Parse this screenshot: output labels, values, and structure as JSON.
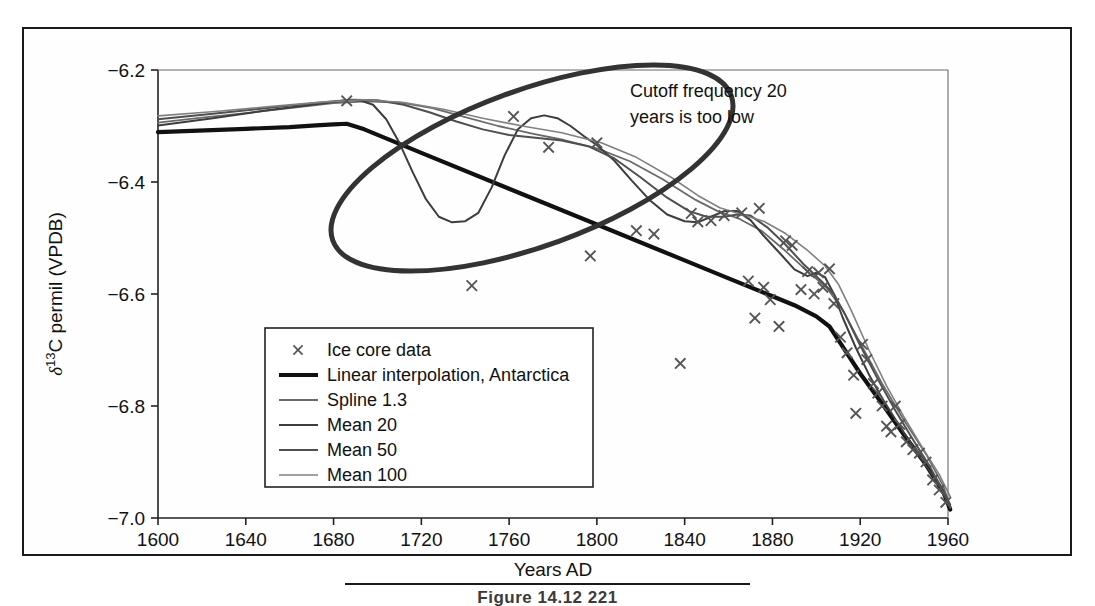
{
  "figure": {
    "caption": "Figure 14.12      221",
    "annotation": [
      "Cutoff frequency 20",
      "years is too low"
    ],
    "highlight_shape": "ellipse"
  },
  "chart_data": {
    "type": "line",
    "title": "",
    "xlabel": "Years AD",
    "ylabel": "δ¹³C permil (VPDB)",
    "ylabel_parts": {
      "delta": "δ",
      "sup": "13",
      "rest": "C permil (VPDB)"
    },
    "xlim": [
      1600,
      1960
    ],
    "ylim": [
      -7.0,
      -6.2
    ],
    "xticks": [
      1600,
      1640,
      1680,
      1720,
      1760,
      1800,
      1840,
      1880,
      1920,
      1960
    ],
    "xtick_labels": [
      "1600",
      "1640",
      "1680",
      "1720",
      "1760",
      "1800",
      "1840",
      "1880",
      "1920",
      "1960"
    ],
    "yticks": [
      -6.2,
      -6.4,
      -6.6,
      -6.8,
      -7.0
    ],
    "ytick_labels": [
      "−6.2",
      "−6.4",
      "−6.6",
      "−6.8",
      "−7.0"
    ],
    "grid": false,
    "legend_position": "lower-left",
    "scatter": {
      "name": "Ice core data",
      "marker": "x",
      "color": "#555555",
      "points": [
        [
          1686,
          -6.255
        ],
        [
          1743,
          -6.585
        ],
        [
          1762,
          -6.283
        ],
        [
          1778,
          -6.338
        ],
        [
          1797,
          -6.532
        ],
        [
          1800,
          -6.33
        ],
        [
          1818,
          -6.487
        ],
        [
          1826,
          -6.493
        ],
        [
          1838,
          -6.724
        ],
        [
          1843,
          -6.456
        ],
        [
          1846,
          -6.471
        ],
        [
          1852,
          -6.469
        ],
        [
          1858,
          -6.46
        ],
        [
          1866,
          -6.455
        ],
        [
          1869,
          -6.577
        ],
        [
          1872,
          -6.643
        ],
        [
          1874,
          -6.447
        ],
        [
          1876,
          -6.588
        ],
        [
          1879,
          -6.61
        ],
        [
          1883,
          -6.658
        ],
        [
          1886,
          -6.505
        ],
        [
          1889,
          -6.513
        ],
        [
          1893,
          -6.592
        ],
        [
          1896,
          -6.56
        ],
        [
          1899,
          -6.6
        ],
        [
          1901,
          -6.562
        ],
        [
          1903,
          -6.588
        ],
        [
          1906,
          -6.555
        ],
        [
          1908,
          -6.617
        ],
        [
          1911,
          -6.677
        ],
        [
          1914,
          -6.705
        ],
        [
          1917,
          -6.745
        ],
        [
          1918,
          -6.813
        ],
        [
          1921,
          -6.69
        ],
        [
          1923,
          -6.717
        ],
        [
          1926,
          -6.76
        ],
        [
          1928,
          -6.777
        ],
        [
          1930,
          -6.8
        ],
        [
          1932,
          -6.836
        ],
        [
          1934,
          -6.846
        ],
        [
          1936,
          -6.8
        ],
        [
          1938,
          -6.833
        ],
        [
          1941,
          -6.864
        ],
        [
          1944,
          -6.878
        ],
        [
          1947,
          -6.884
        ],
        [
          1950,
          -6.9
        ],
        [
          1953,
          -6.932
        ],
        [
          1956,
          -6.95
        ],
        [
          1959,
          -6.972
        ]
      ]
    },
    "series": [
      {
        "name": "Linear interpolation, Antarctica",
        "color": "#111111",
        "width": 4.2,
        "points": [
          [
            1600,
            -6.311
          ],
          [
            1640,
            -6.305
          ],
          [
            1660,
            -6.302
          ],
          [
            1672,
            -6.299
          ],
          [
            1680,
            -6.297
          ],
          [
            1686,
            -6.296
          ],
          [
            1694,
            -6.306
          ],
          [
            1720,
            -6.348
          ],
          [
            1760,
            -6.412
          ],
          [
            1800,
            -6.476
          ],
          [
            1840,
            -6.54
          ],
          [
            1860,
            -6.572
          ],
          [
            1880,
            -6.604
          ],
          [
            1890,
            -6.62
          ],
          [
            1900,
            -6.64
          ],
          [
            1906,
            -6.658
          ],
          [
            1912,
            -6.694
          ],
          [
            1920,
            -6.742
          ],
          [
            1930,
            -6.796
          ],
          [
            1940,
            -6.852
          ],
          [
            1950,
            -6.905
          ],
          [
            1958,
            -6.955
          ],
          [
            1961,
            -6.985
          ]
        ]
      },
      {
        "name": "Spline 1.3",
        "color": "#6a6a6a",
        "width": 1.8,
        "points": [
          [
            1600,
            -6.294
          ],
          [
            1620,
            -6.285
          ],
          [
            1640,
            -6.277
          ],
          [
            1660,
            -6.268
          ],
          [
            1680,
            -6.259
          ],
          [
            1695,
            -6.256
          ],
          [
            1710,
            -6.258
          ],
          [
            1725,
            -6.268
          ],
          [
            1740,
            -6.284
          ],
          [
            1755,
            -6.3
          ],
          [
            1770,
            -6.313
          ],
          [
            1785,
            -6.325
          ],
          [
            1800,
            -6.34
          ],
          [
            1815,
            -6.363
          ],
          [
            1830,
            -6.395
          ],
          [
            1845,
            -6.432
          ],
          [
            1855,
            -6.452
          ],
          [
            1865,
            -6.466
          ],
          [
            1875,
            -6.487
          ],
          [
            1885,
            -6.52
          ],
          [
            1895,
            -6.556
          ],
          [
            1905,
            -6.59
          ],
          [
            1912,
            -6.628
          ],
          [
            1920,
            -6.688
          ],
          [
            1930,
            -6.76
          ],
          [
            1940,
            -6.826
          ],
          [
            1950,
            -6.886
          ],
          [
            1958,
            -6.944
          ],
          [
            1961,
            -6.982
          ]
        ]
      },
      {
        "name": "Mean 20",
        "color": "#3d3d3d",
        "width": 2.0,
        "points": [
          [
            1600,
            -6.299
          ],
          [
            1625,
            -6.286
          ],
          [
            1650,
            -6.272
          ],
          [
            1670,
            -6.262
          ],
          [
            1686,
            -6.254
          ],
          [
            1692,
            -6.254
          ],
          [
            1698,
            -6.262
          ],
          [
            1704,
            -6.288
          ],
          [
            1710,
            -6.33
          ],
          [
            1716,
            -6.382
          ],
          [
            1722,
            -6.43
          ],
          [
            1728,
            -6.462
          ],
          [
            1734,
            -6.472
          ],
          [
            1740,
            -6.47
          ],
          [
            1746,
            -6.455
          ],
          [
            1752,
            -6.41
          ],
          [
            1758,
            -6.352
          ],
          [
            1764,
            -6.306
          ],
          [
            1770,
            -6.286
          ],
          [
            1776,
            -6.281
          ],
          [
            1782,
            -6.286
          ],
          [
            1788,
            -6.3
          ],
          [
            1794,
            -6.318
          ],
          [
            1800,
            -6.334
          ],
          [
            1808,
            -6.362
          ],
          [
            1816,
            -6.398
          ],
          [
            1824,
            -6.432
          ],
          [
            1832,
            -6.458
          ],
          [
            1840,
            -6.47
          ],
          [
            1846,
            -6.472
          ],
          [
            1852,
            -6.462
          ],
          [
            1858,
            -6.452
          ],
          [
            1864,
            -6.452
          ],
          [
            1870,
            -6.468
          ],
          [
            1876,
            -6.496
          ],
          [
            1884,
            -6.53
          ],
          [
            1890,
            -6.556
          ],
          [
            1896,
            -6.568
          ],
          [
            1900,
            -6.562
          ],
          [
            1904,
            -6.57
          ],
          [
            1908,
            -6.6
          ],
          [
            1912,
            -6.642
          ],
          [
            1918,
            -6.696
          ],
          [
            1924,
            -6.744
          ],
          [
            1930,
            -6.786
          ],
          [
            1938,
            -6.836
          ],
          [
            1946,
            -6.884
          ],
          [
            1954,
            -6.93
          ],
          [
            1961,
            -6.98
          ]
        ]
      },
      {
        "name": "Mean 50",
        "color": "#4f4f4f",
        "width": 2.0,
        "points": [
          [
            1600,
            -6.288
          ],
          [
            1625,
            -6.278
          ],
          [
            1650,
            -6.268
          ],
          [
            1672,
            -6.259
          ],
          [
            1688,
            -6.253
          ],
          [
            1700,
            -6.254
          ],
          [
            1712,
            -6.262
          ],
          [
            1724,
            -6.276
          ],
          [
            1736,
            -6.292
          ],
          [
            1748,
            -6.306
          ],
          [
            1760,
            -6.316
          ],
          [
            1772,
            -6.321
          ],
          [
            1784,
            -6.326
          ],
          [
            1796,
            -6.336
          ],
          [
            1808,
            -6.358
          ],
          [
            1820,
            -6.392
          ],
          [
            1832,
            -6.428
          ],
          [
            1842,
            -6.452
          ],
          [
            1850,
            -6.462
          ],
          [
            1858,
            -6.462
          ],
          [
            1864,
            -6.458
          ],
          [
            1870,
            -6.46
          ],
          [
            1878,
            -6.482
          ],
          [
            1886,
            -6.512
          ],
          [
            1894,
            -6.546
          ],
          [
            1902,
            -6.576
          ],
          [
            1908,
            -6.6
          ],
          [
            1913,
            -6.636
          ],
          [
            1920,
            -6.692
          ],
          [
            1928,
            -6.752
          ],
          [
            1936,
            -6.808
          ],
          [
            1944,
            -6.86
          ],
          [
            1952,
            -6.91
          ],
          [
            1961,
            -6.976
          ]
        ]
      },
      {
        "name": "Mean 100",
        "color": "#808080",
        "width": 1.6,
        "points": [
          [
            1600,
            -6.282
          ],
          [
            1626,
            -6.274
          ],
          [
            1652,
            -6.265
          ],
          [
            1676,
            -6.257
          ],
          [
            1694,
            -6.253
          ],
          [
            1712,
            -6.258
          ],
          [
            1730,
            -6.27
          ],
          [
            1748,
            -6.286
          ],
          [
            1766,
            -6.3
          ],
          [
            1784,
            -6.312
          ],
          [
            1802,
            -6.33
          ],
          [
            1818,
            -6.356
          ],
          [
            1834,
            -6.392
          ],
          [
            1846,
            -6.424
          ],
          [
            1856,
            -6.446
          ],
          [
            1866,
            -6.458
          ],
          [
            1876,
            -6.47
          ],
          [
            1886,
            -6.492
          ],
          [
            1896,
            -6.522
          ],
          [
            1904,
            -6.55
          ],
          [
            1910,
            -6.582
          ],
          [
            1916,
            -6.63
          ],
          [
            1924,
            -6.7
          ],
          [
            1932,
            -6.764
          ],
          [
            1940,
            -6.82
          ],
          [
            1948,
            -6.872
          ],
          [
            1956,
            -6.922
          ],
          [
            1961,
            -6.962
          ]
        ]
      }
    ],
    "legend": [
      {
        "label": "Ice core data",
        "marker": "x",
        "color": "#555555",
        "width": 0
      },
      {
        "label": "Linear interpolation, Antarctica",
        "marker": "line",
        "color": "#111111",
        "width": 4.2
      },
      {
        "label": "Spline 1.3",
        "marker": "line",
        "color": "#6a6a6a",
        "width": 1.8
      },
      {
        "label": "Mean 20",
        "marker": "line",
        "color": "#3d3d3d",
        "width": 2.0
      },
      {
        "label": "Mean 50",
        "marker": "line",
        "color": "#4f4f4f",
        "width": 2.0
      },
      {
        "label": "Mean 100",
        "marker": "line",
        "color": "#808080",
        "width": 1.6
      }
    ]
  }
}
